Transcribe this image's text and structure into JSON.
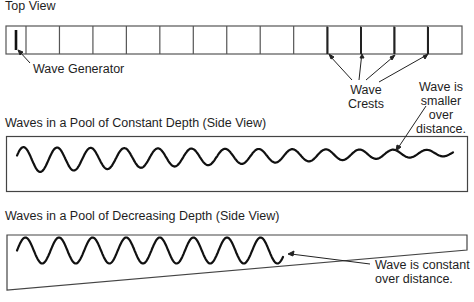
{
  "sections": {
    "top_view": {
      "title": "Top View",
      "cell_count": 13,
      "generator_label": "Wave Generator",
      "crests_label_line1": "Wave",
      "crests_label_line2": "Crests"
    },
    "constant_depth": {
      "title": "Waves in a Pool of Constant Depth (Side View)",
      "note_line1": "Wave is",
      "note_line2": "smaller",
      "note_line3": "over",
      "note_line4": "distance.",
      "wave_cycles": 13,
      "amplitude_start": 13,
      "amplitude_end": 3
    },
    "decreasing_depth": {
      "title": "Waves in a Pool of Decreasing Depth (Side View)",
      "note_line1": "Wave is constant",
      "note_line2": "over distance.",
      "wave_cycles": 8,
      "amplitude": 13
    }
  },
  "colors": {
    "line": "#2b2b2b",
    "wave": "#111111",
    "grid": "#555555"
  }
}
